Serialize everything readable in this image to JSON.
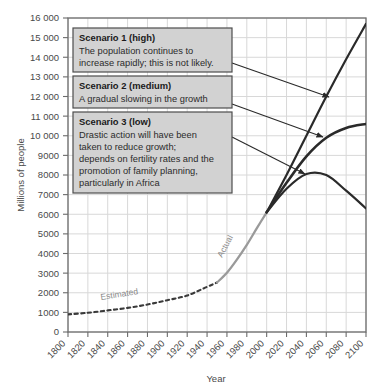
{
  "chart_data": {
    "type": "line",
    "title": "",
    "xlabel": "Year",
    "ylabel": "Millions of people",
    "xlim": [
      1800,
      2100
    ],
    "ylim": [
      0,
      16000
    ],
    "grid": true,
    "legend_position": "none",
    "xticks": [
      "1800",
      "1820",
      "1840",
      "1860",
      "1880",
      "1900",
      "1920",
      "1940",
      "1960",
      "1980",
      "2000",
      "2020",
      "2040",
      "2060",
      "2080",
      "2100"
    ],
    "yticks": [
      "0",
      "1000",
      "2000",
      "3000",
      "4000",
      "5000",
      "6000",
      "7000",
      "8000",
      "9000",
      "10000",
      "11000",
      "12000",
      "13000",
      "14000",
      "15000",
      "16000"
    ],
    "series": [
      {
        "name": "Estimated",
        "style": "dashed",
        "color": "#3a3a3a",
        "x": [
          1800,
          1820,
          1840,
          1860,
          1880,
          1900,
          1920,
          1940,
          1950
        ],
        "values": [
          900,
          980,
          1100,
          1230,
          1400,
          1620,
          1860,
          2300,
          2520
        ]
      },
      {
        "name": "Actual",
        "style": "solid",
        "color": "#9a9a9a",
        "x": [
          1950,
          1960,
          1970,
          1980,
          1990,
          2000
        ],
        "values": [
          2520,
          3020,
          3690,
          4440,
          5280,
          6100
        ]
      },
      {
        "name": "Scenario 1 (high)",
        "style": "solid",
        "color": "#2a2a2a",
        "x": [
          2000,
          2020,
          2040,
          2060,
          2080,
          2100
        ],
        "values": [
          6100,
          8000,
          10000,
          12000,
          13900,
          15700
        ]
      },
      {
        "name": "Scenario 2 (medium)",
        "style": "solid",
        "color": "#2a2a2a",
        "x": [
          2000,
          2020,
          2040,
          2060,
          2080,
          2100
        ],
        "values": [
          6100,
          7600,
          8950,
          9900,
          10400,
          10600
        ]
      },
      {
        "name": "Scenario 3 (low)",
        "style": "solid",
        "color": "#2a2a2a",
        "x": [
          2000,
          2020,
          2040,
          2060,
          2080,
          2100
        ],
        "values": [
          6100,
          7300,
          8050,
          8000,
          7200,
          6300
        ]
      }
    ],
    "annotations": [
      {
        "id": "scenario1",
        "title": "Scenario 1 (high)",
        "lines": [
          "The population continues to",
          "increase rapidly; this is not likely."
        ]
      },
      {
        "id": "scenario2",
        "title": "Scenario 2 (medium)",
        "lines": [
          "A gradual slowing in the growth"
        ]
      },
      {
        "id": "scenario3",
        "title": "Scenario 3 (low)",
        "lines": [
          "Drastic action will have been",
          "taken to reduce growth;",
          "depends on fertility rates and the",
          "promotion of family planning,",
          "particularly in Africa"
        ]
      }
    ],
    "curve_labels": [
      {
        "id": "estimated",
        "text": "Estimated"
      },
      {
        "id": "actual",
        "text": "Actual"
      }
    ]
  }
}
